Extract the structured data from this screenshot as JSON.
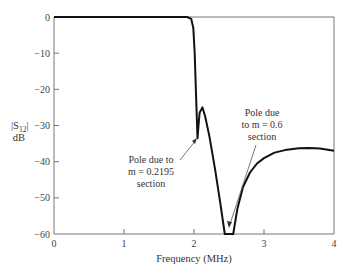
{
  "chart_data": {
    "type": "line",
    "title": "",
    "xlabel": "Frequency (MHz)",
    "ylabel": "|S12| dB",
    "ylabel_parts": {
      "main": "|S",
      "sub": "12",
      "end": "|",
      "unit": "dB"
    },
    "xlim": [
      0,
      4
    ],
    "ylim": [
      -60,
      0
    ],
    "grid": false,
    "legend": null,
    "x_ticks": [
      "0",
      "1",
      "2",
      "3",
      "4"
    ],
    "y_ticks": [
      "0",
      "−10",
      "−20",
      "−30",
      "−40",
      "−50",
      "−60"
    ],
    "series": [
      {
        "name": "|S12|",
        "x": [
          0,
          0.5,
          1.0,
          1.5,
          1.9,
          1.96,
          1.99,
          2.01,
          2.03,
          2.045,
          2.05,
          2.06,
          2.08,
          2.12,
          2.16,
          2.22,
          2.3,
          2.38,
          2.44,
          2.47,
          2.5,
          2.53,
          2.56,
          2.62,
          2.7,
          2.8,
          2.9,
          3.0,
          3.15,
          3.3,
          3.5,
          3.65,
          3.8,
          4.0
        ],
        "y": [
          0,
          0,
          0,
          0,
          0,
          -0.5,
          -3,
          -10,
          -22,
          -31,
          -33.5,
          -31,
          -26.5,
          -25,
          -27.5,
          -33,
          -42,
          -52,
          -60,
          -60,
          -60,
          -60,
          -60,
          -53,
          -47,
          -43,
          -40.5,
          -39,
          -37.5,
          -36.8,
          -36.3,
          -36.2,
          -36.4,
          -37
        ]
      }
    ],
    "annotations": [
      {
        "text": [
          "Pole due to",
          "m = 0.2195",
          "section"
        ],
        "target_x": 2.05,
        "target_y": -33.5
      },
      {
        "text": [
          "Pole due",
          "to m = 0.6",
          "section"
        ],
        "target_x": 2.5,
        "target_y": -58
      }
    ]
  },
  "axis": {
    "xlabel": "Frequency (MHz)",
    "ylabel_main": "|S",
    "ylabel_sub": "12",
    "ylabel_end": "|",
    "ylabel_unit": "dB"
  },
  "annotations": {
    "a1": {
      "line1": "Pole due to",
      "line2": "m = 0.2195",
      "line3": "section"
    },
    "a2": {
      "line1": "Pole due",
      "line2": "to m = 0.6",
      "line3": "section"
    }
  }
}
